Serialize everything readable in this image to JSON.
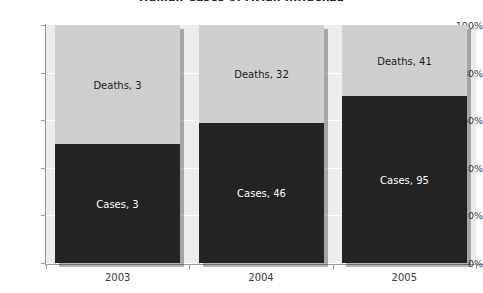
{
  "chart_data": {
    "type": "bar",
    "subtype": "100% stacked column",
    "title": "Human Cases of Avian Influenza",
    "xlabel": "",
    "ylabel": "",
    "categories": [
      "2003",
      "2004",
      "2005"
    ],
    "ylim": [
      0,
      100
    ],
    "y_tick_labels": [
      "0%",
      "20%",
      "40%",
      "60%",
      "80%",
      "100%"
    ],
    "y_tick_values": [
      0,
      20,
      40,
      60,
      80,
      100
    ],
    "grid": true,
    "legend": "none (data labels inside segments)",
    "series": [
      {
        "name": "Cases",
        "values": [
          3,
          46,
          95
        ],
        "percent_values": [
          50,
          59,
          70
        ],
        "color": "#232323",
        "labels": [
          "Cases, 3",
          "Cases, 46",
          "Cases, 95"
        ]
      },
      {
        "name": "Deaths",
        "values": [
          3,
          32,
          41
        ],
        "percent_values": [
          50,
          41,
          30
        ],
        "color": "#cfcfcf",
        "labels": [
          "Deaths, 3",
          "Deaths, 32",
          "Deaths, 41"
        ]
      }
    ],
    "plot_background": "#ececec",
    "gridline_color": "#ffffff",
    "axis_color": "#9a9a9a"
  }
}
